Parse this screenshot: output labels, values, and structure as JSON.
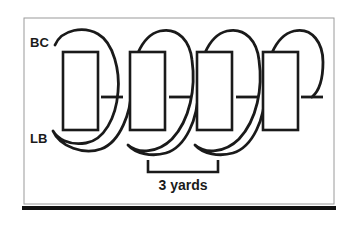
{
  "figure": {
    "type": "football-drill-diagram",
    "title": "",
    "background_color": "#ffffff",
    "ink_color": "#1a1a1a",
    "frame": {
      "border_color": "#9a9a9a",
      "border_width_px": 1,
      "baseline_color": "#111111",
      "baseline_width_px": 4,
      "x": 24,
      "y": 18,
      "width": 310,
      "height": 186
    },
    "labels": [
      {
        "id": "bc",
        "text": "BC",
        "x": 30,
        "y": 47,
        "font_size": 13
      },
      {
        "id": "lb",
        "text": "LB",
        "x": 30,
        "y": 143,
        "font_size": 13
      }
    ],
    "bags": {
      "count": 4,
      "label": "blocking bag",
      "stroke_width": 2.6,
      "items": [
        {
          "x": 63,
          "y": 52,
          "width": 35,
          "height": 78
        },
        {
          "x": 130,
          "y": 52,
          "width": 35,
          "height": 78
        },
        {
          "x": 197,
          "y": 52,
          "width": 35,
          "height": 78
        },
        {
          "x": 263,
          "y": 52,
          "width": 35,
          "height": 78
        }
      ]
    },
    "weave_path": {
      "label": "ball-carrier weave path",
      "stroke_width": 2.8,
      "loops": 4,
      "d": "M 55 45 C 62 29, 84 26, 98 34 C 114 43, 120 72, 118 92 C 116 118, 104 140, 86 143 C 68 146, 57 138, 53 131 C 60 147, 84 155, 101 149 C 121 142, 131 110, 131 92 C 131 64, 140 36, 160 31 C 179 27, 190 42, 192 60 C 196 88, 190 120, 172 139 C 158 153, 138 154, 128 145 C 136 154, 152 157, 166 153 C 186 147, 198 118, 198 92 C 198 64, 207 36, 227 31 C 246 27, 257 42, 259 60 C 263 88, 257 120, 239 139 C 225 153, 205 154, 195 145 C 203 154, 219 157, 233 153 C 253 147, 265 118, 265 92 C 265 64, 274 36, 294 31 C 313 27, 323 44, 323 62 C 323 82, 318 92, 312 97"
    },
    "markers": {
      "label": "defender-contact marker",
      "stroke_width": 2.8,
      "arm_half_width": 11,
      "items": [
        {
          "x": 112,
          "y": 97
        },
        {
          "x": 180,
          "y": 97
        },
        {
          "x": 247,
          "y": 97
        },
        {
          "x": 312,
          "y": 97
        }
      ]
    },
    "measure": {
      "text": "3 yards",
      "text_x": 183,
      "text_y": 190,
      "font_size": 14,
      "bracket": {
        "x1": 148,
        "x2": 218,
        "y": 172,
        "tick_height": 12,
        "stroke_width": 2.6
      }
    }
  }
}
